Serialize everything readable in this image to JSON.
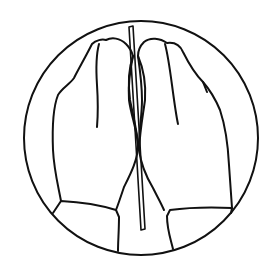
{
  "illustration": {
    "subject": "two hands pressed together holding a thin stick, inside a circle",
    "colors": {
      "background": "#ffffff",
      "line": "#111111"
    }
  }
}
